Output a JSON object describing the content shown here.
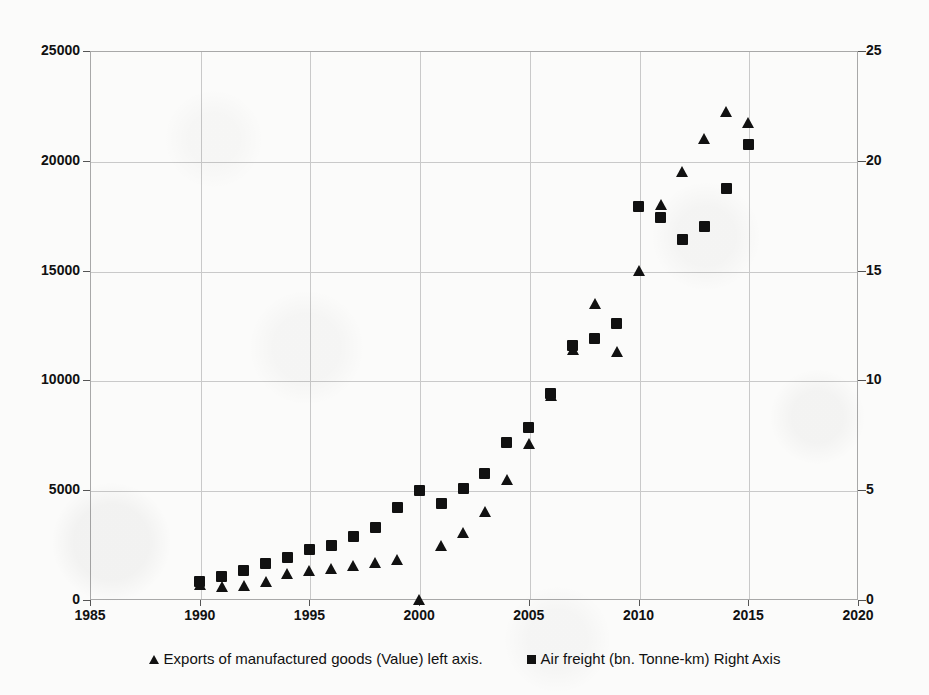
{
  "chart_data": {
    "type": "scatter",
    "title": "",
    "subtitle": "",
    "xlabel": "",
    "ylabel": "",
    "xlim": [
      1985,
      2020
    ],
    "ylim": [
      0,
      25000
    ],
    "y2lim": [
      0,
      25
    ],
    "grid": true,
    "legend_position": "bottom",
    "x_ticks": [
      1985,
      1990,
      1995,
      2000,
      2005,
      2010,
      2015,
      2020
    ],
    "y_ticks_left": [
      0,
      5000,
      10000,
      15000,
      20000,
      25000
    ],
    "y_ticks_right": [
      0,
      5,
      10,
      15,
      20,
      25
    ],
    "x": [
      1990,
      1991,
      1992,
      1993,
      1994,
      1995,
      1996,
      1997,
      1998,
      1999,
      2000,
      2001,
      2002,
      2003,
      2004,
      2005,
      2006,
      2007,
      2008,
      2009,
      2010,
      2011,
      2012,
      2013,
      2014,
      2015
    ],
    "series": [
      {
        "name": "Exports of manufactured goods (Value) left axis.",
        "axis": "left",
        "marker": "triangle",
        "color": "#111111",
        "values": [
          700,
          600,
          650,
          800,
          1200,
          1300,
          1400,
          1550,
          1700,
          1800,
          0,
          2450,
          3050,
          4000,
          5450,
          7100,
          9300,
          11400,
          13500,
          11300,
          15000,
          18000,
          19500,
          21000,
          22200,
          21700
        ]
      },
      {
        "name": "Air freight (bn. Tonne-km) Right Axis",
        "axis": "right",
        "marker": "square",
        "color": "#111111",
        "values": [
          0.85,
          1.05,
          1.35,
          1.65,
          1.95,
          2.3,
          2.5,
          2.9,
          3.3,
          4.2,
          5.0,
          4.4,
          5.1,
          5.75,
          7.15,
          7.85,
          9.4,
          11.6,
          11.9,
          12.6,
          17.9,
          17.4,
          16.4,
          17.0,
          18.75,
          20.75
        ]
      }
    ]
  },
  "legend": {
    "entries": [
      {
        "label": "Exports of manufactured goods (Value) left axis.",
        "marker": "triangle"
      },
      {
        "label": "Air freight (bn. Tonne-km) Right Axis",
        "marker": "square"
      }
    ]
  },
  "colors": {
    "marker": "#111111",
    "grid": "#c9c9c9",
    "frame": "#a8a8a8",
    "background": "#fbfbfa"
  }
}
